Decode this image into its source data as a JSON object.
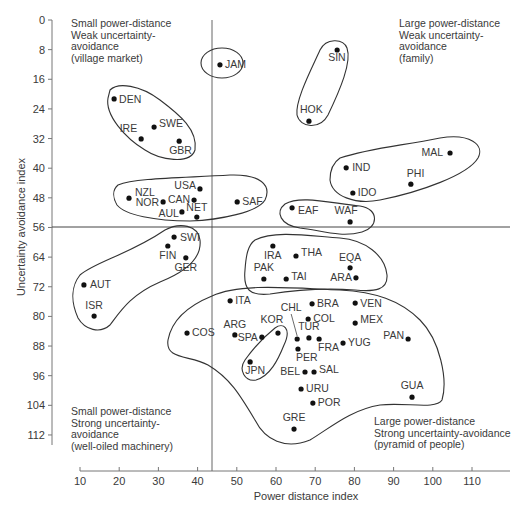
{
  "chart_data": {
    "type": "scatter",
    "title": "",
    "xlabel": "Power distance index",
    "ylabel": "Uncertainty avoidance index",
    "xlim": [
      8,
      121
    ],
    "ylim": [
      0,
      116
    ],
    "y_inverted": true,
    "grid": false,
    "xticks": [
      10,
      20,
      30,
      40,
      50,
      60,
      70,
      80,
      90,
      100,
      110
    ],
    "yticks": [
      0,
      8,
      16,
      24,
      32,
      40,
      48,
      56,
      64,
      72,
      80,
      88,
      96,
      104,
      112
    ],
    "dividers": {
      "x": 43.7,
      "y": 56
    },
    "points": [
      {
        "label": "DEN",
        "x": 18.7,
        "y": 21.3
      },
      {
        "label": "SWE",
        "x": 28.9,
        "y": 28.9
      },
      {
        "label": "IRE",
        "x": 25.6,
        "y": 32.1
      },
      {
        "label": "GBR",
        "x": 35.3,
        "y": 32.7
      },
      {
        "label": "JAM",
        "x": 45.7,
        "y": 12.1
      },
      {
        "label": "SIN",
        "x": 75.6,
        "y": 8.1
      },
      {
        "label": "HOK",
        "x": 68.4,
        "y": 27.3
      },
      {
        "label": "MAL",
        "x": 104.4,
        "y": 35.9
      },
      {
        "label": "IND",
        "x": 77.9,
        "y": 39.9
      },
      {
        "label": "PHI",
        "x": 94.4,
        "y": 44.3
      },
      {
        "label": "IDO",
        "x": 79.6,
        "y": 46.7
      },
      {
        "label": "WAF",
        "x": 78.9,
        "y": 54.5
      },
      {
        "label": "EAF",
        "x": 64.1,
        "y": 50.7
      },
      {
        "label": "USA",
        "x": 40.6,
        "y": 45.6
      },
      {
        "label": "CAN",
        "x": 39.1,
        "y": 48.6
      },
      {
        "label": "NZL",
        "x": 22.5,
        "y": 48.1
      },
      {
        "label": "NOR",
        "x": 31.2,
        "y": 49.1
      },
      {
        "label": "AUL",
        "x": 36.0,
        "y": 51.8
      },
      {
        "label": "NET",
        "x": 39.8,
        "y": 53.2
      },
      {
        "label": "SAF",
        "x": 50.1,
        "y": 49.1
      },
      {
        "label": "SWI",
        "x": 34.0,
        "y": 58.6
      },
      {
        "label": "FIN",
        "x": 32.4,
        "y": 61.0
      },
      {
        "label": "GER",
        "x": 37.0,
        "y": 64.2
      },
      {
        "label": "AUT",
        "x": 11.0,
        "y": 71.5
      },
      {
        "label": "ISR",
        "x": 13.6,
        "y": 79.9
      },
      {
        "label": "IRA",
        "x": 59.2,
        "y": 61.0
      },
      {
        "label": "THA",
        "x": 65.1,
        "y": 63.7
      },
      {
        "label": "PAK",
        "x": 56.9,
        "y": 69.9
      },
      {
        "label": "TAI",
        "x": 62.6,
        "y": 69.9
      },
      {
        "label": "EQA",
        "x": 78.9,
        "y": 66.9
      },
      {
        "label": "ARA",
        "x": 80.4,
        "y": 69.6
      },
      {
        "label": "ITA",
        "x": 48.3,
        "y": 75.8
      },
      {
        "label": "BRA",
        "x": 69.2,
        "y": 76.6
      },
      {
        "label": "VEN",
        "x": 80.2,
        "y": 76.4
      },
      {
        "label": "COL",
        "x": 68.2,
        "y": 80.7
      },
      {
        "label": "MEX",
        "x": 80.2,
        "y": 81.8
      },
      {
        "label": "COS",
        "x": 37.3,
        "y": 84.5
      },
      {
        "label": "ARG",
        "x": 49.5,
        "y": 85.0
      },
      {
        "label": "SPA",
        "x": 56.4,
        "y": 85.6
      },
      {
        "label": "KOR",
        "x": 60.5,
        "y": 84.5
      },
      {
        "label": "CHL",
        "x": 65.4,
        "y": 86.1
      },
      {
        "label": "TUR",
        "x": 68.4,
        "y": 85.8
      },
      {
        "label": "FRA",
        "x": 71.0,
        "y": 86.1
      },
      {
        "label": "YUG",
        "x": 77.1,
        "y": 87.2
      },
      {
        "label": "PAN",
        "x": 93.7,
        "y": 86.1
      },
      {
        "label": "PER",
        "x": 65.6,
        "y": 88.8
      },
      {
        "label": "JPN",
        "x": 53.4,
        "y": 92.3
      },
      {
        "label": "BEL",
        "x": 67.4,
        "y": 95.0
      },
      {
        "label": "SAL",
        "x": 69.7,
        "y": 95.0
      },
      {
        "label": "URU",
        "x": 66.4,
        "y": 99.6
      },
      {
        "label": "POR",
        "x": 69.4,
        "y": 103.4
      },
      {
        "label": "GUA",
        "x": 94.7,
        "y": 101.8
      },
      {
        "label": "GRE",
        "x": 64.6,
        "y": 110.4
      }
    ],
    "annotations": [
      {
        "lines": [
          "Small power-distance",
          "Weak uncertainty-",
          "avoidance",
          "(village market)"
        ]
      },
      {
        "lines": [
          "Large power-distance",
          "Weak uncertainty-",
          "avoidance",
          "(family)"
        ]
      },
      {
        "lines": [
          "Small power-distance",
          "Strong uncertainty-",
          "avoidance",
          "(well-oiled machinery)"
        ]
      },
      {
        "lines": [
          "Large power-distance",
          "Strong uncertainty-avoidance",
          "(pyramid of people)"
        ]
      }
    ],
    "clusters": [
      [
        "DEN",
        "SWE",
        "IRE",
        "GBR"
      ],
      [
        "JAM"
      ],
      [
        "SIN",
        "HOK"
      ],
      [
        "MAL",
        "IND",
        "PHI",
        "IDO"
      ],
      [
        "EAF",
        "WAF"
      ],
      [
        "USA",
        "CAN",
        "NZL",
        "NOR",
        "AUL",
        "NET",
        "SAF"
      ],
      [
        "SWI",
        "FIN",
        "GER",
        "AUT",
        "ISR"
      ],
      [
        "IRA",
        "THA",
        "PAK",
        "TAI",
        "EQA",
        "ARA"
      ],
      [
        "JPN",
        "KOR"
      ],
      [
        "ITA",
        "BRA",
        "VEN",
        "COL",
        "MEX",
        "COS",
        "ARG",
        "SPA",
        "CHL",
        "TUR",
        "FRA",
        "YUG",
        "PAN",
        "PER",
        "BEL",
        "SAL",
        "URU",
        "POR",
        "GUA",
        "GRE"
      ]
    ]
  },
  "labels": {
    "xlabel": "Power distance index",
    "ylabel": "Uncertainty avoidance index"
  }
}
